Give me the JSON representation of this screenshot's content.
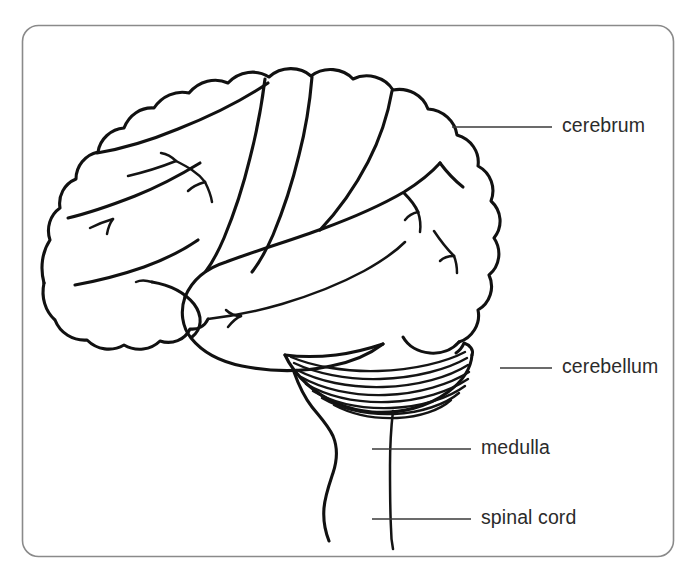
{
  "figure": {
    "background_color": "#ffffff",
    "border_color": "#8a8a8a",
    "line_color": "#111111",
    "label_color": "#2b2b2b",
    "width": 699,
    "height": 578
  },
  "labels": [
    {
      "id": "cerebrum",
      "text": "cerebrum",
      "x": 562,
      "y": 127,
      "leader": {
        "x1": 452,
        "y1": 127,
        "x2": 552,
        "y2": 127
      }
    },
    {
      "id": "cerebellum",
      "text": "cerebellum",
      "x": 562,
      "y": 368,
      "leader": {
        "x1": 500,
        "y1": 368,
        "x2": 552,
        "y2": 368
      }
    },
    {
      "id": "medulla",
      "text": "medulla",
      "x": 481,
      "y": 449,
      "leader": {
        "x1": 372,
        "y1": 449,
        "x2": 471,
        "y2": 449
      }
    },
    {
      "id": "spinal-cord",
      "text": "spinal cord",
      "x": 481,
      "y": 519,
      "leader": {
        "x1": 372,
        "y1": 519,
        "x2": 471,
        "y2": 519
      }
    }
  ],
  "structures": [
    {
      "id": "cerebrum",
      "name": "cerebrum"
    },
    {
      "id": "cerebellum",
      "name": "cerebellum"
    },
    {
      "id": "medulla",
      "name": "medulla"
    },
    {
      "id": "spinal-cord",
      "name": "spinal cord"
    },
    {
      "id": "temporal-lobe",
      "name": "temporal lobe"
    },
    {
      "id": "brainstem",
      "name": "brainstem"
    }
  ],
  "cerebellum_hatch_count": 8
}
